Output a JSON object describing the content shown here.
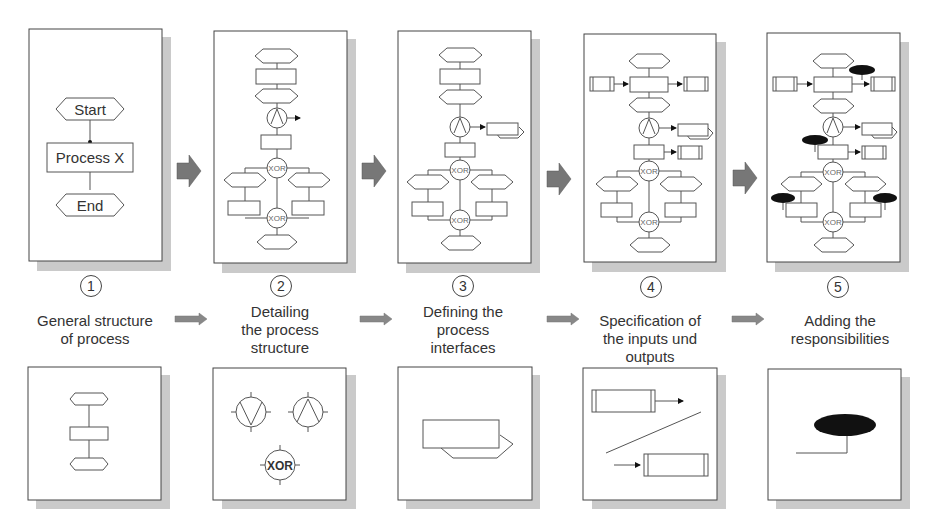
{
  "diagram": {
    "title": "",
    "steps": [
      {
        "number": "1",
        "label_lines": [
          "General structure",
          "of process"
        ]
      },
      {
        "number": "2",
        "label_lines": [
          "Detailing",
          "the process",
          "structure"
        ]
      },
      {
        "number": "3",
        "label_lines": [
          "Defining the",
          "process",
          "interfaces"
        ]
      },
      {
        "number": "4",
        "label_lines": [
          "Specification of",
          "the inputs und",
          "outputs"
        ]
      },
      {
        "number": "5",
        "label_lines": [
          "Adding the",
          "responsibilities"
        ]
      }
    ],
    "panel1": {
      "start": "Start",
      "process": "Process X",
      "end": "End"
    },
    "xor_label": "XOR",
    "colors": {
      "arrow": "#777777",
      "shadow": "#c8c8c8",
      "line": "#555555",
      "fill_black": "#111111"
    }
  }
}
